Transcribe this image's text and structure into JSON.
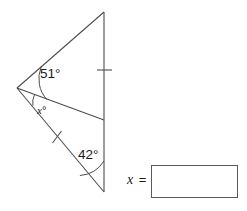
{
  "figure": {
    "type": "geometry-diagram",
    "line_color": "#4d4d4d",
    "labels": {
      "angle_top": "51°",
      "angle_middle": "x°",
      "angle_middle_variable": "x",
      "angle_middle_unit": "°",
      "angle_bottom": "42°"
    },
    "angle_values": {
      "angle_top_degrees": 51,
      "angle_bottom_degrees": 42,
      "angle_unknown_label": "x"
    },
    "vertices": {
      "left": {
        "x": 17,
        "y": 88
      },
      "top": {
        "x": 104,
        "y": 12
      },
      "middle_right": {
        "x": 104,
        "y": 120
      },
      "bottom": {
        "x": 104,
        "y": 192
      }
    },
    "congruence_ticks": [
      {
        "name": "tick-upper-vertical",
        "x": 104,
        "y": 70
      },
      {
        "name": "tick-lower-diagonal",
        "x": 57,
        "y": 137
      }
    ]
  },
  "answer": {
    "prefix_variable": "x",
    "prefix_equals": "=",
    "value": "",
    "placeholder": ""
  }
}
